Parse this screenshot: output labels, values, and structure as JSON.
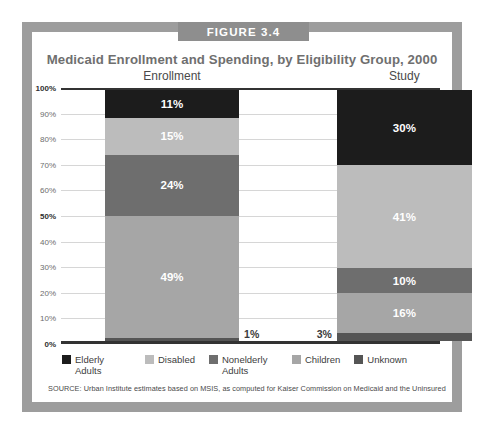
{
  "figure": {
    "banner_label": "FIGURE 3.4",
    "title": "Medicaid Enrollment and Spending, by Eligibility Group, 2000",
    "source_note": "SOURCE: Urban Institute estimates based on MSIS, as computed for Kaiser Commission on Medicaid and the Uninsured"
  },
  "chart_data": {
    "type": "bar",
    "title": "Medicaid Enrollment and Spending, by Eligibility Group, 2000",
    "xlabel": "",
    "ylabel": "",
    "ylim": [
      0,
      100
    ],
    "grid": true,
    "stacked": true,
    "legend_position": "bottom",
    "categories": [
      "Enrollment",
      "Study"
    ],
    "tick_labels": [
      "100%",
      "90%",
      "80%",
      "70%",
      "60%",
      "50%",
      "40%",
      "30%",
      "20%",
      "10%",
      "0%"
    ],
    "major_ticks": [
      "100%",
      "50%",
      "0%"
    ],
    "series": [
      {
        "name": "Elderly Adults",
        "color": "#1c1c1c",
        "values": [
          11,
          30
        ],
        "labels": [
          "11%",
          "30%"
        ],
        "label_placement": [
          "inside",
          "inside"
        ]
      },
      {
        "name": "Disabled",
        "color": "#bcbcbc",
        "values": [
          15,
          41
        ],
        "labels": [
          "15%",
          "41%"
        ],
        "label_placement": [
          "inside",
          "inside"
        ]
      },
      {
        "name": "Nonelderly Adults",
        "color": "#6e6e6e",
        "values": [
          24,
          10
        ],
        "labels": [
          "24%",
          "10%"
        ],
        "label_placement": [
          "inside",
          "inside"
        ]
      },
      {
        "name": "Children",
        "color": "#a6a6a6",
        "values": [
          49,
          16
        ],
        "labels": [
          "49%",
          "16%"
        ],
        "label_placement": [
          "inside",
          "inside"
        ]
      },
      {
        "name": "Unknown",
        "color": "#555555",
        "values": [
          1,
          3
        ],
        "labels": [
          "1%",
          "3%"
        ],
        "label_placement": [
          "outside-right",
          "outside-left"
        ]
      }
    ]
  },
  "legend": {
    "items": [
      {
        "label": "Elderly Adults",
        "color": "#1c1c1c"
      },
      {
        "label": "Disabled",
        "color": "#bcbcbc"
      },
      {
        "label": "Nonelderly Adults",
        "color": "#6e6e6e"
      },
      {
        "label": "Children",
        "color": "#a6a6a6"
      },
      {
        "label": "Unknown",
        "color": "#555555"
      }
    ]
  }
}
